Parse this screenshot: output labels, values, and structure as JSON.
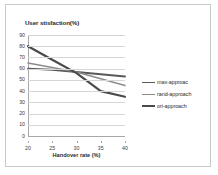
{
  "chart_data": {
    "type": "line",
    "title": "User stisfaction(%)",
    "xlabel": "Handover rate (%)",
    "ylabel": "",
    "x": [
      20,
      25,
      30,
      35,
      40
    ],
    "categories": [
      "20",
      "25",
      "30",
      "35",
      "40"
    ],
    "xlim": [
      20,
      40
    ],
    "ylim": [
      0,
      90
    ],
    "y_ticks": [
      0,
      10,
      20,
      30,
      40,
      50,
      60,
      70,
      80,
      90
    ],
    "x_ticks": [
      20,
      25,
      30,
      35,
      40
    ],
    "grid": "horizontal",
    "legend_position": "right",
    "series": [
      {
        "name": "max-approac",
        "values": [
          60,
          59,
          57,
          55,
          53
        ],
        "color": "#595959",
        "width": 1.9
      },
      {
        "name": "rand-approach",
        "values": [
          65,
          61,
          57,
          51,
          45
        ],
        "color": "#8c8c8c",
        "width": 1.5
      },
      {
        "name": "ori-approach",
        "values": [
          80,
          68,
          56,
          40,
          35
        ],
        "color": "#4a4a4a",
        "width": 2.2
      }
    ]
  },
  "figure": {
    "background": "#ffffff",
    "border_color": "#c9c9c9",
    "gridline_color": "#d6d6d6",
    "axis_color": "#a8a8a8"
  }
}
